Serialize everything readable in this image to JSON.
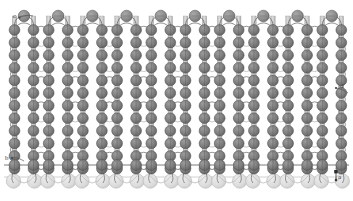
{
  "figure": {
    "type": "knitted-loop-diagram",
    "canvas": {
      "width": 353,
      "height": 201,
      "background": "#ffffff"
    }
  },
  "labels": [
    {
      "id": "a",
      "text": "a",
      "x": 338,
      "y": 174,
      "points_to": "bottom-right needle loop"
    },
    {
      "id": "b",
      "text": "b",
      "x": 5,
      "y": 155,
      "points_to": "left lower sinker arc"
    },
    {
      "id": "c",
      "text": "c",
      "x": 13,
      "y": 13,
      "points_to": "top-left head loop"
    },
    {
      "id": "d",
      "text": "d",
      "x": 340,
      "y": 83,
      "points_to": "right mid yarn crossover"
    }
  ],
  "colors": {
    "node_dark": "#7a7a7a",
    "node_dark_stroke": "#4a4a4a",
    "node_head": "#8c8c8c",
    "node_faded": "#d8d8d8",
    "node_faded_stroke": "#bdbdbd",
    "yarn_line": "#6e6e6e",
    "yarn_line_light": "#b5b5b5",
    "bar_fill": "#c9c9c9",
    "bar_stroke": "#9a9a9a",
    "background": "#ffffff",
    "label_text": "#3a3a3a"
  },
  "chart_data": {
    "type": "diagram",
    "wales": 10,
    "courses": 12,
    "geometry": {
      "wale_pitch": 34.2,
      "wale_x_start": 24,
      "leg_half_gap": 9.5,
      "course_pitch": 12.6,
      "course_y_start": 30,
      "head_row_y": 16,
      "bottom_dark_row_y": 165,
      "faded_row_y": 181,
      "node_radius": 5.4,
      "head_radius": 5.8,
      "faded_radius": 7.2
    },
    "wale_labels": [
      "1",
      "2",
      "3",
      "4",
      "5",
      "6",
      "7",
      "8",
      "9",
      "10"
    ],
    "course_labels": [
      "1",
      "2",
      "3",
      "4",
      "5",
      "6",
      "7",
      "8",
      "9",
      "10",
      "11",
      "12"
    ],
    "legend": [
      {
        "key": "head-loop",
        "label": "head loop (needle loop crown)",
        "color": "#8c8c8c"
      },
      {
        "key": "leg-node",
        "label": "loop leg node",
        "color": "#7a7a7a"
      },
      {
        "key": "sinker-arc",
        "label": "sinker loop arc",
        "color": "#6e6e6e"
      },
      {
        "key": "ghost-row",
        "label": "partial / cut-off course",
        "color": "#d8d8d8"
      }
    ]
  }
}
